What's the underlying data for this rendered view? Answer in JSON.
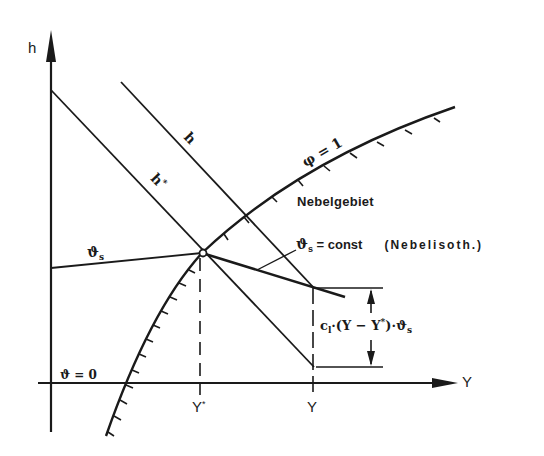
{
  "diagram": {
    "type": "h-Y diagram (Mollier moist air), fog region construction",
    "stroke_color": "#1a1a1a",
    "background_color": "#ffffff",
    "axes": {
      "vertical": {
        "label": "h"
      },
      "horizontal": {
        "label": "Y"
      }
    },
    "curves": {
      "saturation": {
        "label_phi": "φ",
        "label_eq": "= 1",
        "region_label": "Nebelgebiet"
      },
      "enthalpy_h": {
        "label": "h"
      },
      "enthalpy_h_star": {
        "label": "h",
        "label_sup": "*"
      },
      "isotherm_left": {
        "label": "ϑ",
        "label_sub": "s"
      },
      "fog_isotherm": {
        "label": "ϑ",
        "label_sub": "s",
        "label_rest": " = const",
        "label_paren": "(Nebelisoth.)"
      },
      "zero_isotherm": {
        "label": "ϑ = 0"
      }
    },
    "ticks": {
      "y_star": {
        "label": "Y",
        "label_sup": "*"
      },
      "y": {
        "label": "Y"
      }
    },
    "dimension": {
      "label_c": "c",
      "label_c_sub": "l",
      "label_mid": "·(Y − Y",
      "label_mid_sup": "*",
      "label_end": ")·ϑ",
      "label_end_sub": "s"
    }
  }
}
